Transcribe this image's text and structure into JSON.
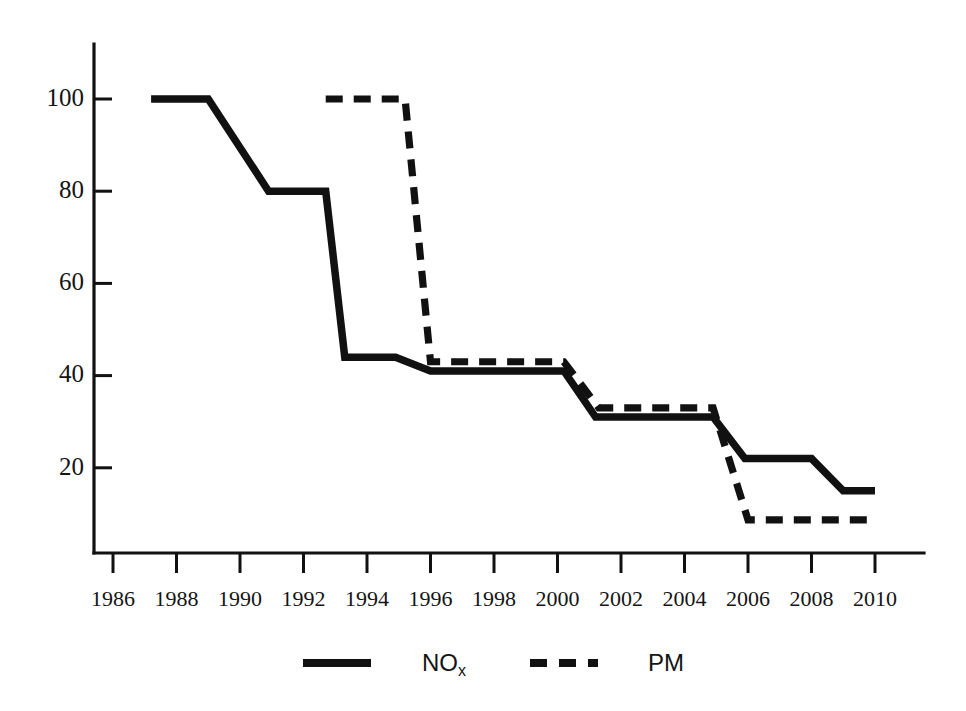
{
  "chart_data": {
    "type": "line",
    "title": "",
    "subtitle": "",
    "xlabel": "",
    "ylabel": "",
    "xlim": [
      1985.15,
      1985.15
    ],
    "ylim": [
      0,
      112
    ],
    "grid": false,
    "legend_position": "bottom",
    "x_ticks": [
      "1986",
      "1988",
      "1990",
      "1992",
      "1994",
      "1996",
      "1998",
      "2000",
      "2002",
      "2004",
      "2006",
      "2008",
      "2010"
    ],
    "y_ticks": [
      "20",
      "40",
      "60",
      "80",
      "100"
    ],
    "y_tick_values": [
      20,
      40,
      60,
      80,
      100
    ],
    "x_tick_values": [
      1986,
      1988,
      1990,
      1992,
      1994,
      1996,
      1998,
      2000,
      2002,
      2004,
      2006,
      2008,
      2010
    ],
    "series": [
      {
        "name": "NOx",
        "style": "solid",
        "color": "#111111",
        "points": [
          [
            1987.2,
            100
          ],
          [
            1989.0,
            100
          ],
          [
            1990.9,
            80
          ],
          [
            1992.7,
            80
          ],
          [
            1993.3,
            44
          ],
          [
            1994.9,
            44
          ],
          [
            1996.0,
            41
          ],
          [
            2000.2,
            41
          ],
          [
            2001.2,
            31
          ],
          [
            2004.9,
            31
          ],
          [
            2005.9,
            22
          ],
          [
            2008.0,
            22
          ],
          [
            2009.0,
            15
          ],
          [
            2010.0,
            15
          ]
        ]
      },
      {
        "name": "PM",
        "style": "dashed",
        "color": "#111111",
        "points": [
          [
            1992.7,
            100
          ],
          [
            1995.2,
            100
          ],
          [
            1996.0,
            43
          ],
          [
            2000.2,
            43
          ],
          [
            2001.3,
            33
          ],
          [
            2004.9,
            33
          ],
          [
            2006.0,
            8.7
          ],
          [
            2010.0,
            8.7
          ]
        ]
      }
    ]
  },
  "legend": {
    "items": [
      {
        "label": "NO",
        "subscript": "x",
        "style": "solid"
      },
      {
        "label": "PM",
        "subscript": "",
        "style": "dashed"
      }
    ]
  }
}
